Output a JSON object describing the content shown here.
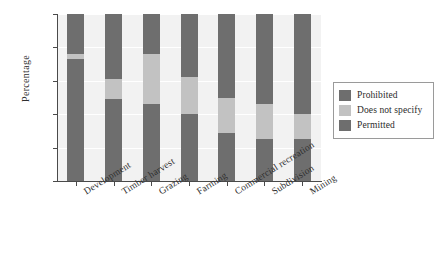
{
  "chart_data": {
    "type": "bar",
    "subtype": "stacked-percentage",
    "title": "",
    "xlabel": "",
    "ylabel": "Percentage",
    "ylim": [
      0,
      100
    ],
    "yticks": [
      0,
      20,
      40,
      60,
      80,
      100
    ],
    "ytick_labels": [
      "0",
      "20",
      "40",
      "60",
      "80",
      "100"
    ],
    "grid": "horizontal-white",
    "legend_position": "right",
    "categories": [
      "Development",
      "Timber harvest",
      "Grazing",
      "Farming",
      "Commercial recreation",
      "Subdivision",
      "Mining"
    ],
    "series": [
      {
        "name": "Permitted",
        "color": "#6e6e6e",
        "values": [
          73,
          49,
          46,
          40,
          29,
          25,
          25
        ]
      },
      {
        "name": "Does not specify",
        "color": "#c2c2c2",
        "values": [
          3,
          12,
          30,
          22,
          21,
          21,
          15
        ]
      },
      {
        "name": "Prohibited",
        "color": "#6e6e6e",
        "values": [
          24,
          39,
          24,
          38,
          50,
          54,
          60
        ]
      }
    ]
  },
  "legend": {
    "items": [
      {
        "label": "Prohibited",
        "color": "#6e6e6e"
      },
      {
        "label": "Does not specify",
        "color": "#c2c2c2"
      },
      {
        "label": "Permitted",
        "color": "#6e6e6e"
      }
    ]
  },
  "colors": {
    "dark_gray": "#6e6e6e",
    "light_gray": "#c2c2c2",
    "plot_background": "#f2f2f2",
    "figure_background": "#ffffff",
    "axis": "#4a4a4a"
  }
}
